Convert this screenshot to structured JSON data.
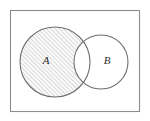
{
  "figure": {
    "kind": "venn-diagram",
    "caption": "",
    "universe_frame": {
      "name": "universal-set-rectangle",
      "x": 10.5,
      "y": 10.5,
      "width": 129,
      "height": 101,
      "stroke": "#8c8c8c",
      "stroke_width": 1.1,
      "fill": "#ffffff"
    },
    "sets": [
      {
        "id": "A",
        "label": "A",
        "label_x": 46,
        "label_y": 61,
        "cx": 55,
        "cy": 62,
        "r": 35,
        "stroke": "#6f6f6f",
        "stroke_width": 1.1,
        "fill": "none",
        "shaded": true
      },
      {
        "id": "B",
        "label": "B",
        "label_x": 107,
        "label_y": 61,
        "cx": 101,
        "cy": 62,
        "r": 27,
        "stroke": "#6f6f6f",
        "stroke_width": 1.1,
        "fill": "none",
        "shaded": false
      }
    ],
    "shaded_region": {
      "name": "a-minus-b",
      "description": "A \\ B",
      "hatch": {
        "pattern": "diagonal-forward-slash",
        "angle_deg": 45,
        "spacing": 3,
        "line_width": 0.6,
        "color": "#7d7d7d",
        "background": "#fcfcfc"
      }
    },
    "colors": {
      "frame_stroke": "#8c8c8c",
      "circle_stroke": "#6f6f6f",
      "hatch_line": "#7d7d7d",
      "label_text": "#2b2b2b",
      "page_background": "#ffffff"
    }
  }
}
